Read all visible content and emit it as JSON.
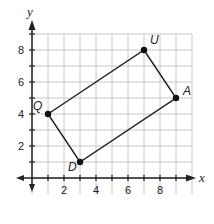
{
  "figure": {
    "x_axis_label": "x",
    "y_axis_label": "y",
    "x_ticks": [
      {
        "value": 2,
        "label": "2"
      },
      {
        "value": 4,
        "label": "4"
      },
      {
        "value": 6,
        "label": "6"
      },
      {
        "value": 8,
        "label": "8"
      }
    ],
    "y_ticks": [
      {
        "value": 2,
        "label": "2"
      },
      {
        "value": 4,
        "label": "4"
      },
      {
        "value": 6,
        "label": "6"
      },
      {
        "value": 8,
        "label": "8"
      }
    ],
    "grid": {
      "x_min": 0,
      "x_max": 10,
      "y_min": -1,
      "y_max": 9
    },
    "polygon": {
      "name": "QUAD",
      "vertices": [
        {
          "label": "Q",
          "x": 1,
          "y": 4
        },
        {
          "label": "U",
          "x": 7,
          "y": 8
        },
        {
          "label": "A",
          "x": 9,
          "y": 5
        },
        {
          "label": "D",
          "x": 3,
          "y": 1
        }
      ]
    },
    "colors": {
      "grid": "#c8c8c8",
      "axis": "#222222",
      "polygon": "#222222"
    }
  }
}
